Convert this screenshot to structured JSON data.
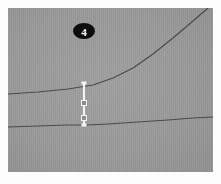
{
  "figure": {
    "panel_label": "4",
    "background_color": "#9a9a9a",
    "margin_color": "#ffffff",
    "panel_box": {
      "x": 8,
      "y": 8,
      "width": 205,
      "height": 164
    }
  },
  "badge": {
    "label": "4",
    "shape": "ellipse",
    "fill_color": "#0d0d0d",
    "text_color": "#ffffff",
    "center_x": 76,
    "center_y": 23,
    "radius_x": 11,
    "radius_y": 8
  },
  "curves": [
    {
      "name": "upper-curve",
      "color": "#4a4a4a",
      "stroke_width": 1.2,
      "description": "upper boundary rising steeply toward the top right",
      "points": "0,86 30,84 60,81 85,77 105,70 125,60 145,46 165,30 185,13 200,0"
    },
    {
      "name": "lower-curve",
      "color": "#4a4a4a",
      "stroke_width": 1.2,
      "description": "lower boundary, gently rising to the right",
      "points": "0,119 30,118 60,117 80,117 100,116 130,114 160,112 185,110 205,109"
    }
  ],
  "measurement": {
    "name": "vertical-measurement-line",
    "color": "#f2f2f2",
    "stroke_width": 2.2,
    "x": 76,
    "y_top": 75,
    "y_bottom": 117,
    "length_px": 42,
    "endpoints": [
      {
        "name": "top-endpoint",
        "x": 76,
        "y": 75
      },
      {
        "name": "bottom-endpoint",
        "x": 76,
        "y": 117
      }
    ],
    "markers": [
      {
        "name": "marker-upper",
        "x": 76,
        "y": 95,
        "size": 5
      },
      {
        "name": "marker-lower",
        "x": 76,
        "y": 110,
        "size": 5
      }
    ],
    "marker_fill": "#8d8d8d",
    "marker_stroke": "#f2f2f2"
  }
}
